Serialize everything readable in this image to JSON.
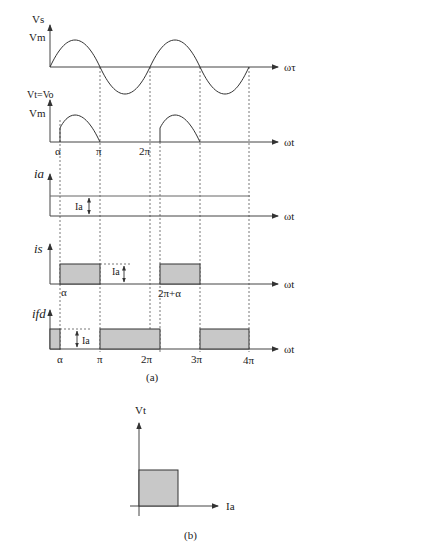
{
  "figure": {
    "part_a": {
      "caption": "(a)",
      "panels": [
        {
          "id": "vs",
          "y_label": "Vs",
          "level_label": "Vm",
          "x_label": "ωτ"
        },
        {
          "id": "vt",
          "y_label": "Vt=Vo",
          "level_label": "Vm",
          "x_label": "ωt",
          "ticks": [
            "α",
            "π",
            "2π"
          ]
        },
        {
          "id": "ia",
          "y_label": "ia",
          "level_label": "Ia",
          "x_label": "ωt"
        },
        {
          "id": "is",
          "y_label": "is",
          "level_label": "Ia",
          "x_label": "ωt",
          "ticks": [
            "α",
            "2π+α"
          ]
        },
        {
          "id": "ifd",
          "y_label": "ifd",
          "level_label": "Ia",
          "x_label": "ωt",
          "ticks": [
            "α",
            "π",
            "2π",
            "3π",
            "4π"
          ]
        }
      ]
    },
    "part_b": {
      "caption": "(b)",
      "y_label": "Vt",
      "x_label": "Ia"
    },
    "colors": {
      "line": "#333333",
      "fill": "#c8c8c8",
      "background": "#ffffff"
    }
  }
}
